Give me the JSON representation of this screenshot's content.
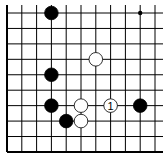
{
  "diagram": {
    "type": "go-board-fragment",
    "columns": 11,
    "rows": 10,
    "edges": [
      "left",
      "bottom"
    ],
    "origin_px": [
      7,
      13
    ],
    "spacing_px": [
      14.8,
      15.44
    ],
    "hoshi": [
      {
        "col": 9,
        "row": 0
      }
    ],
    "stones": [
      {
        "color": "black",
        "col": 3,
        "row": 0,
        "label": ""
      },
      {
        "color": "white",
        "col": 6,
        "row": 3,
        "label": ""
      },
      {
        "color": "black",
        "col": 3,
        "row": 4,
        "label": ""
      },
      {
        "color": "black",
        "col": 3,
        "row": 6,
        "label": ""
      },
      {
        "color": "white",
        "col": 5,
        "row": 6,
        "label": ""
      },
      {
        "color": "white",
        "col": 7,
        "row": 6,
        "label": "1"
      },
      {
        "color": "black",
        "col": 9,
        "row": 6,
        "label": ""
      },
      {
        "color": "black",
        "col": 4,
        "row": 7,
        "label": ""
      },
      {
        "color": "white",
        "col": 5,
        "row": 7,
        "label": ""
      }
    ],
    "colors": {
      "line": "#000000",
      "black_stone": "#000000",
      "white_stone": "#ffffff"
    }
  }
}
